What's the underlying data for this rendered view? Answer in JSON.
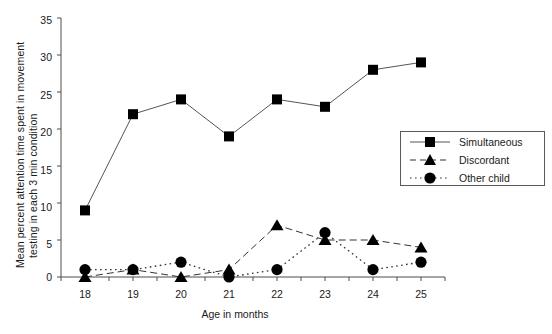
{
  "chart_data": {
    "type": "line",
    "title": "",
    "xlabel": "Age in months",
    "ylabel": "Mean percent attention time spent in movement testing in each 3 min condition",
    "ylabel_line1": "Mean percent attention time spent in movement",
    "ylabel_line2": "testing in each 3 min condition",
    "x": [
      18,
      19,
      20,
      21,
      22,
      23,
      24,
      25
    ],
    "categories": [
      "18",
      "19",
      "20",
      "21",
      "22",
      "23",
      "24",
      "25"
    ],
    "xlim": [
      17.5,
      25.5
    ],
    "ylim": [
      0,
      35
    ],
    "yticks": [
      0,
      5,
      10,
      15,
      20,
      25,
      30,
      35
    ],
    "yticklabels": [
      "0",
      "5",
      "10",
      "15",
      "20",
      "25",
      "30",
      "35"
    ],
    "xticklabels": [
      "18",
      "19",
      "20",
      "21",
      "22",
      "23",
      "24",
      "25"
    ],
    "grid": false,
    "legend_position": "right-middle",
    "series": [
      {
        "name": "Simultaneous",
        "marker": "square",
        "linestyle": "solid",
        "color": "#000000",
        "values": [
          9,
          22,
          24,
          19,
          24,
          23,
          28,
          29
        ]
      },
      {
        "name": "Discordant",
        "marker": "triangle",
        "linestyle": "dashed",
        "color": "#000000",
        "values": [
          0,
          1,
          0,
          1,
          7,
          5,
          5,
          4
        ]
      },
      {
        "name": "Other child",
        "marker": "circle",
        "linestyle": "dotted",
        "color": "#000000",
        "values": [
          1,
          1,
          2,
          0,
          1,
          6,
          1,
          2
        ]
      }
    ]
  },
  "legend": {
    "items": [
      {
        "label": "Simultaneous",
        "marker": "square",
        "linestyle": "solid"
      },
      {
        "label": "Discordant",
        "marker": "triangle",
        "linestyle": "dashed"
      },
      {
        "label": "Other child",
        "marker": "circle",
        "linestyle": "dotted"
      }
    ]
  },
  "colors": {
    "axis": "#4d4d4d",
    "data": "#000000",
    "line": "#555555",
    "background": "#ffffff"
  }
}
